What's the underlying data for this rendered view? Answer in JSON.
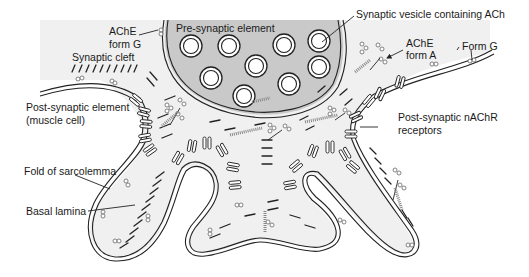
{
  "diagram": {
    "labels": {
      "presynaptic": "Pre-synaptic element",
      "vesicle": "Synaptic vesicle containing ACh",
      "ache_g_line1": "AChE",
      "ache_g_line2": "form G",
      "cleft": "Synaptic cleft",
      "ache_a_line1": "AChE",
      "ache_a_line2": "form A",
      "form_g": "Form G",
      "postsynaptic_line1": "Post-synaptic element",
      "postsynaptic_line2": "(muscle cell)",
      "nachr_line1": "Post-synaptic nAChR",
      "nachr_line2": "receptors",
      "fold": "Fold of sarcolemma",
      "basal": "Basal lamina"
    },
    "colors": {
      "background": "#ffffff",
      "cleft_fill": "#f0f0f0",
      "presynaptic_fill": "#c9c9c9",
      "outline": "#222222",
      "enzyme": "#777777"
    }
  }
}
